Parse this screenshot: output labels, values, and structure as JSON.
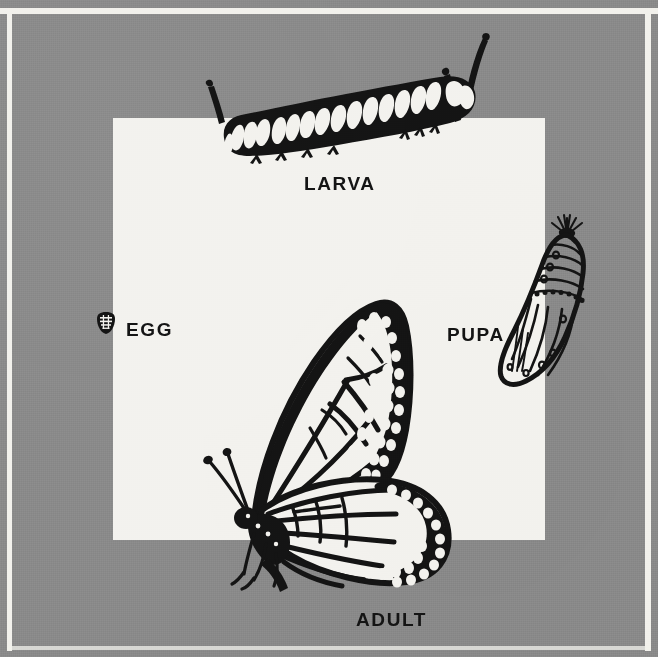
{
  "figure": {
    "background_color": "#8a8a8a",
    "panel_color": "#f3f2ee",
    "ink_color": "#141414",
    "frame_rule_color": "#f2f1ec"
  },
  "labels": {
    "larva": "LARVA",
    "egg": "EGG",
    "pupa": "PUPA",
    "adult": "ADULT"
  },
  "stages": [
    {
      "name": "egg",
      "label": "EGG",
      "illustration": "butterfly-egg-icon"
    },
    {
      "name": "larva",
      "label": "LARVA",
      "illustration": "monarch-caterpillar-illustration"
    },
    {
      "name": "pupa",
      "label": "PUPA",
      "illustration": "monarch-chrysalis-illustration"
    },
    {
      "name": "adult",
      "label": "ADULT",
      "illustration": "monarch-butterfly-illustration"
    }
  ]
}
